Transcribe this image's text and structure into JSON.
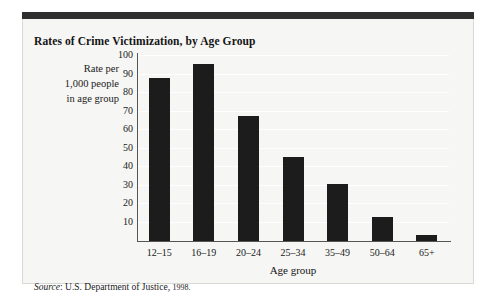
{
  "figure": {
    "title": "Rates of Crime Victimization, by Age Group",
    "source_word": "Source",
    "source_text": ": U.S. Department of Justice,",
    "source_year": "1998.",
    "y_axis_title_line1": "Rate per",
    "y_axis_title_line2": "1,000 people",
    "y_axis_title_line3": "in age group"
  },
  "chart_data": {
    "type": "bar",
    "title": "Rates of Crime Victimization, by Age Group",
    "xlabel": "Age group",
    "ylabel": "Rate per 1,000 people in age group",
    "categories": [
      "12–15",
      "16–19",
      "20–24",
      "25–34",
      "35–49",
      "50–64",
      "65+"
    ],
    "values": [
      88,
      95.5,
      67.5,
      45.5,
      31,
      13,
      3
    ],
    "ylim": [
      0,
      100
    ],
    "yticks": [
      10,
      20,
      30,
      40,
      50,
      60,
      70,
      80,
      90,
      100
    ],
    "ytick_labels": [
      "10",
      "20",
      "30",
      "40",
      "50",
      "60",
      "70",
      "80",
      "90",
      "100"
    ],
    "grid": true,
    "legend": "none",
    "bar_color": "#1c1c1c",
    "background_color": "#f6f6f4",
    "source": "Source: U.S. Department of Justice, 1998."
  }
}
